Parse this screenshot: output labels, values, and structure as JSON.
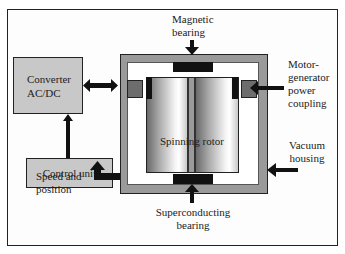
{
  "diagram": {
    "type": "flywheel energy storage system schematic",
    "blocks": {
      "converter": {
        "line1": "Converter",
        "line2": "AC/DC"
      },
      "control_unit": {
        "label": "Control unit"
      },
      "rotor": {
        "label": "Spinning rotor"
      }
    },
    "labels": {
      "magnetic_bearing": {
        "line1": "Magnetic",
        "line2": "bearing"
      },
      "motor_generator": {
        "line1": "Motor-",
        "line2": "generator",
        "line3": "power",
        "line4": "coupling"
      },
      "vacuum_housing": {
        "line1": "Vacuum",
        "line2": "housing"
      },
      "superconducting_bearing": {
        "line1": "Superconducting",
        "line2": "bearing"
      },
      "speed_position": {
        "line1": "Speed and",
        "line2": "position"
      }
    },
    "colors": {
      "block_fill": "#c8c8c8",
      "housing_fill": "#9a9a9a",
      "bearing_fill": "#111111",
      "coupling_fill": "#6d6d6d",
      "outline": "#222222"
    }
  }
}
